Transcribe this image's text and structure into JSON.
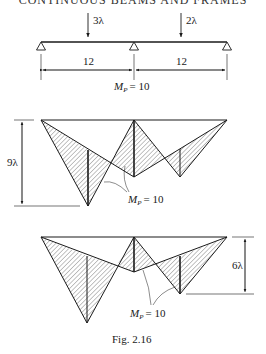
{
  "header": {
    "running_title": "CONTINUOUS BEAMS AND FRAMES"
  },
  "beam": {
    "loads": [
      {
        "label": "3λ",
        "position": "midspan-1"
      },
      {
        "label": "2λ",
        "position": "midspan-2"
      }
    ],
    "spans": [
      {
        "label": "12"
      },
      {
        "label": "12"
      }
    ],
    "supports": 3,
    "plastic_moment": {
      "label": "M",
      "sub": "P",
      "value": "= 10"
    }
  },
  "mechanism_1": {
    "height_label": "9λ",
    "annotation": {
      "label": "M",
      "sub": "P",
      "value": "= 10"
    }
  },
  "mechanism_2": {
    "height_label": "6λ",
    "annotation": {
      "label": "M",
      "sub": "P",
      "value": "= 10"
    }
  },
  "caption": "Fig. 2.16",
  "colors": {
    "ink": "#1a1a1a",
    "hatch": "#444444",
    "background": "#ffffff"
  }
}
